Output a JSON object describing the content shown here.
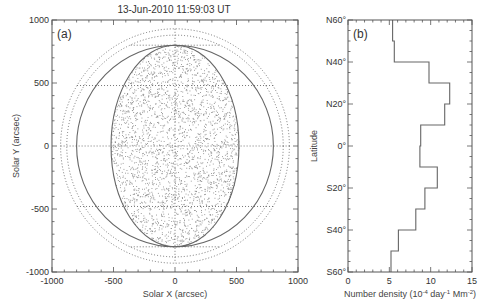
{
  "chart_data": [
    {
      "panel": "(a)",
      "type": "scatter",
      "title": "13-Jun-2010 11:59:03 UT",
      "xlabel": "Solar X (arcsec)",
      "ylabel": "Solar Y (arcsec)",
      "xlim": [
        -1000,
        1000
      ],
      "ylim": [
        -1000,
        1000
      ],
      "xticks": [
        "-1000",
        "-500",
        "0",
        "500",
        "1000"
      ],
      "yticks": [
        "1000",
        "500",
        "0",
        "-500",
        "-1000"
      ],
      "grid": false,
      "description": "Random point distribution filling an elliptical region (half-width ~520 arcsec, half-height ~800 arcsec) inside a solid solar-disk circle (radius ~800 arcsec), with dotted outer circles (~930 and ~880 arcsec) and dotted horizontal/vertical reference lines at y=0, y=±480 and x=0.",
      "shapes": {
        "solid_circle_radius": 800,
        "ellipse_rx": 520,
        "ellipse_ry": 800,
        "dotted_circle_radii": [
          880,
          930
        ],
        "dotted_hlines": [
          800,
          480,
          0,
          -480,
          -800
        ],
        "dotted_vline": 0
      }
    },
    {
      "panel": "(b)",
      "type": "bar",
      "orientation": "horizontal-step",
      "xlabel": "Number density (10^-4 day^-1 Mm^-2)",
      "ylabel": "Latitude",
      "xlim": [
        0,
        15
      ],
      "xticks": [
        "0",
        "5",
        "10",
        "15"
      ],
      "yticks": [
        "N60°",
        "N40°",
        "N20°",
        "0°",
        "S20°",
        "S40°",
        "S60°"
      ],
      "categories": [
        "N60-N50",
        "N50-N40",
        "N40-N30",
        "N30-N20",
        "N20-N10",
        "N10-0",
        "0-S10",
        "S10-S20",
        "S20-S30",
        "S30-S40",
        "S40-S50",
        "S50-S60"
      ],
      "lat_bins": [
        [
          60,
          50
        ],
        [
          50,
          40
        ],
        [
          40,
          30
        ],
        [
          30,
          20
        ],
        [
          20,
          10
        ],
        [
          10,
          0
        ],
        [
          0,
          -10
        ],
        [
          -10,
          -20
        ],
        [
          -20,
          -30
        ],
        [
          -30,
          -40
        ],
        [
          -40,
          -50
        ],
        [
          -50,
          -60
        ]
      ],
      "values": [
        5.4,
        5.6,
        9.8,
        12.3,
        11.7,
        8.8,
        8.7,
        10.8,
        9.3,
        8.2,
        6.1,
        5.2
      ]
    }
  ],
  "labels": {
    "title": "13-Jun-2010 11:59:03 UT",
    "panel_a": "(a)",
    "panel_b": "(b)",
    "a_xlabel": "Solar X (arcsec)",
    "a_ylabel": "Solar Y (arcsec)",
    "b_ylabel": "Latitude",
    "b_xlabel_main": "Number density (10",
    "b_xlabel_exp1": "-4",
    "b_xlabel_mid": " day",
    "b_xlabel_exp2": "-1",
    "b_xlabel_mid2": " Mm",
    "b_xlabel_exp3": "-2",
    "b_xlabel_end": ")",
    "a_xticks": [
      "-1000",
      "-500",
      "0",
      "500",
      "1000"
    ],
    "a_yticks": [
      "1000",
      "500",
      "0",
      "-500",
      "-1000"
    ],
    "b_xticks": [
      "0",
      "5",
      "10",
      "15"
    ],
    "b_yticks": [
      "N60°",
      "N40°",
      "N20°",
      "0°",
      "S20°",
      "S40°",
      "S60°"
    ]
  },
  "colors": {
    "axis": "#555555",
    "line": "#666666",
    "dots": "#8a8a8a",
    "text": "#333333"
  }
}
